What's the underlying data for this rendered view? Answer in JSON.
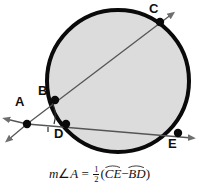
{
  "figure": {
    "background_color": "#ffffff"
  },
  "circle": {
    "fill_color": "#dcdcdc",
    "stroke_color": "#0a0a0a",
    "center_x": 118,
    "center_y": 81,
    "radius": 73,
    "stroke_width": 4
  },
  "points": [
    {
      "id": "A",
      "label": "A",
      "x": 27,
      "y": 124,
      "label_x": 15,
      "label_y": 95,
      "on_circle": false,
      "is_vertex": true,
      "dot": true
    },
    {
      "id": "B",
      "label": "B",
      "x": 55,
      "y": 100,
      "label_x": 38,
      "label_y": 84,
      "on_circle": true,
      "is_vertex": false,
      "dot": true
    },
    {
      "id": "C",
      "label": "C",
      "x": 160,
      "y": 22,
      "label_x": 149,
      "label_y": 2,
      "on_circle": true,
      "is_vertex": false,
      "dot": true
    },
    {
      "id": "D",
      "label": "D",
      "x": 66,
      "y": 124,
      "label_x": 54,
      "label_y": 127,
      "on_circle": true,
      "is_vertex": false,
      "dot": true
    },
    {
      "id": "E",
      "label": "E",
      "x": 178,
      "y": 133,
      "label_x": 168,
      "label_y": 137,
      "on_circle": true,
      "is_vertex": false,
      "dot": true
    }
  ],
  "secants": [
    {
      "id": "secant-abc",
      "from": "A",
      "through": "B",
      "to": "C",
      "stroke_color": "#555555",
      "stroke_width": 1.3,
      "arrow_at_end": true
    },
    {
      "id": "secant-ade",
      "from": "A",
      "through": "D",
      "to": "E",
      "stroke_color": "#555555",
      "stroke_width": 1.3,
      "arrow_at_end": true
    }
  ],
  "rays_from_vertex": [
    {
      "id": "ray-upper-left",
      "stroke_color": "#555555",
      "arrowhead": true
    },
    {
      "id": "ray-lower-left",
      "stroke_color": "#555555",
      "arrowhead": true
    }
  ],
  "angle_mark": {
    "at_point": "A",
    "kind": "arc",
    "stroke_color": "#2a2a2a",
    "tick_count": 1
  },
  "formula": {
    "lhs_m": "m",
    "lhs_angle_symbol": "∠",
    "lhs_vertex": "A",
    "equals": "=",
    "fraction_numerator": "1",
    "fraction_denominator": "2",
    "open_paren": "(",
    "arc_one": "CE",
    "operator": "−",
    "arc_two": "BD",
    "close_paren": ")",
    "plain_text": "m∠A = 1/2(arc CE − arc BD)"
  }
}
